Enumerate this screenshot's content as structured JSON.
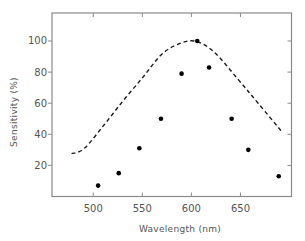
{
  "chart_data": {
    "type": "scatter",
    "title": "",
    "xlabel": "Wavelength (nm)",
    "ylabel": "Sensitivity (%)",
    "xlim": [
      458,
      702
    ],
    "ylim": [
      0,
      118
    ],
    "x_ticks": [
      500,
      550,
      600,
      650
    ],
    "y_ticks": [
      20,
      40,
      60,
      80,
      100
    ],
    "grid": false,
    "legend": null,
    "series": [
      {
        "name": "measured",
        "type": "scatter",
        "marker": "filled-circle",
        "x": [
          505,
          526,
          547,
          569,
          590,
          606,
          618,
          641,
          658,
          689
        ],
        "y": [
          7,
          15,
          31,
          50,
          79,
          100,
          83,
          50,
          30,
          13
        ]
      },
      {
        "name": "reference curve",
        "type": "line",
        "style": "dashed",
        "x": [
          478,
          491,
          511,
          531,
          551,
          569,
          585,
          603,
          623,
          648,
          668,
          693
        ],
        "y": [
          27.5,
          31,
          46,
          62,
          77,
          91,
          97.5,
          100,
          93,
          75,
          60,
          41
        ]
      }
    ]
  }
}
